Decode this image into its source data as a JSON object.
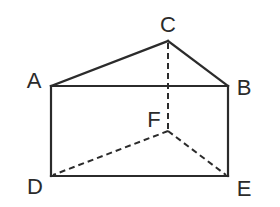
{
  "diagram": {
    "type": "triangular-prism",
    "stroke_color": "#2b2b2b",
    "background": "#ffffff",
    "vertices": {
      "A": {
        "label": "A",
        "x": 51,
        "y": 86,
        "label_x": 34,
        "label_y": 81
      },
      "B": {
        "label": "B",
        "x": 228,
        "y": 86,
        "label_x": 244,
        "label_y": 88
      },
      "C": {
        "label": "C",
        "x": 168,
        "y": 41,
        "label_x": 168,
        "label_y": 25
      },
      "D": {
        "label": "D",
        "x": 51,
        "y": 176,
        "label_x": 35,
        "label_y": 187
      },
      "E": {
        "label": "E",
        "x": 228,
        "y": 176,
        "label_x": 244,
        "label_y": 189
      },
      "F": {
        "label": "F",
        "x": 168,
        "y": 131,
        "label_x": 154,
        "label_y": 120
      }
    },
    "edges_solid": [
      [
        "A",
        "C"
      ],
      [
        "C",
        "B"
      ],
      [
        "A",
        "B"
      ],
      [
        "A",
        "D"
      ],
      [
        "B",
        "E"
      ],
      [
        "D",
        "E"
      ]
    ],
    "edges_dashed": [
      [
        "C",
        "F"
      ],
      [
        "F",
        "D"
      ],
      [
        "F",
        "E"
      ]
    ]
  }
}
